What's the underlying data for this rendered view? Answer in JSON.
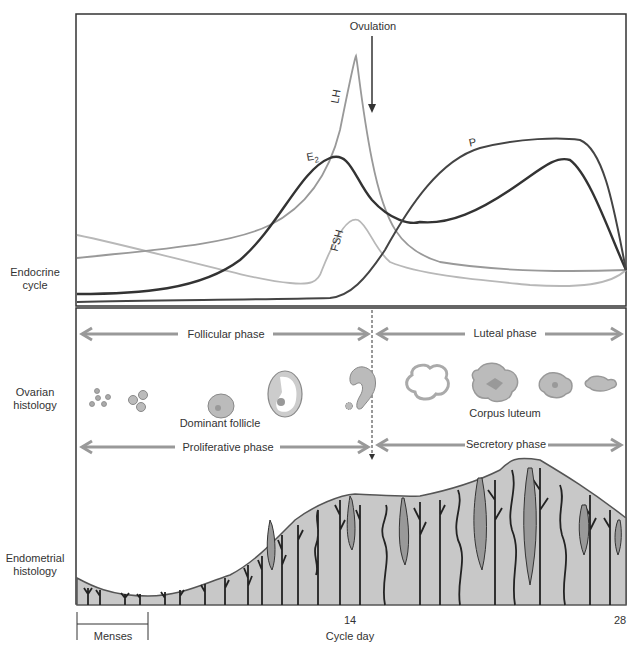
{
  "side_labels": {
    "endocrine": [
      "Endocrine",
      "cycle"
    ],
    "ovarian": [
      "Ovarian",
      "histology"
    ],
    "endometrial": [
      "Endometrial",
      "histology"
    ]
  },
  "endocrine": {
    "ovulation_label": "Ovulation",
    "hormones": [
      {
        "name": "LH",
        "label": "LH",
        "color": "#9a9a9a"
      },
      {
        "name": "E2",
        "label": "E",
        "subscript": "2",
        "color": "#333333"
      },
      {
        "name": "P",
        "label": "P",
        "color": "#444444"
      },
      {
        "name": "FSH",
        "label": "FSH",
        "color": "#b4b4b4"
      }
    ]
  },
  "ovarian": {
    "follicular_phase": "Follicular phase",
    "luteal_phase": "Luteal phase",
    "dominant_follicle": "Dominant follicle",
    "corpus_luteum": "Corpus luteum"
  },
  "endometrial": {
    "proliferative_phase": "Proliferative phase",
    "secretory_phase": "Secretory phase"
  },
  "axis": {
    "tick_14": "14",
    "tick_28": "28",
    "xlabel": "Cycle day",
    "menses": "Menses"
  },
  "colors": {
    "frame": "#333333",
    "arrow": "#999999",
    "tissue": "#c8c8c8",
    "gland": "#222222"
  }
}
